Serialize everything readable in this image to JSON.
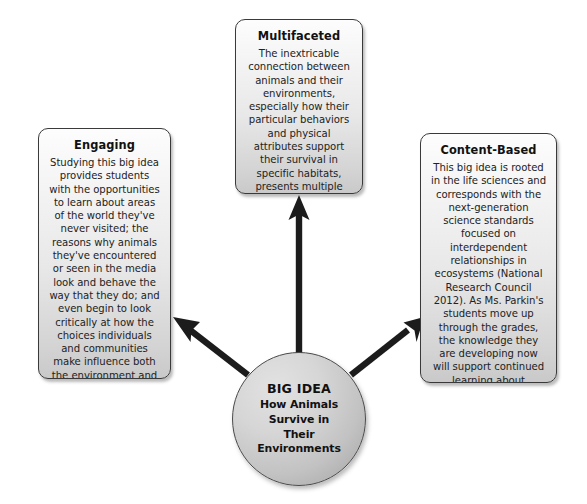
{
  "diagram": {
    "center": {
      "label": "BIG IDEA",
      "text": "How Animals Survive in Their Environments",
      "text_lines": [
        "How Animals",
        "Survive in",
        "Their",
        "Environments"
      ]
    },
    "nodes": [
      {
        "id": "multifaceted",
        "title": "Multifaceted",
        "body": "The inextricable connection between animals and their environments, especially how their particular behaviors and physical attributes support their survival in specific habitats, presents multiple avenues for questioning, wondering, and discovery.",
        "position": "top"
      },
      {
        "id": "engaging",
        "title": "Engaging",
        "body": "Studying this big idea provides students with the opportunities to learn about areas of the world they've never visited; the reasons why animals they've encountered or seen in the media look and behave the way that they do; and even begin to look critically at how the choices individuals and communities make influence both the environment and its animal inhabitants.",
        "position": "left"
      },
      {
        "id": "content-based",
        "title": "Content-Based",
        "body": "This big idea is rooted in the life sciences and corresponds with the next-generation science standards focused on interdependent relationships in ecosystems (National Research Council 2012). As Ms. Parkin's students move up through the grades, the knowledge they are developing now will support continued learning about ecosystems, genetic variation, and population shifts.",
        "position": "right"
      }
    ],
    "connectors": [
      {
        "id": "arrow-to-multifaceted",
        "from": "center",
        "to": "multifaceted",
        "direction": "up"
      },
      {
        "id": "arrow-to-engaging",
        "from": "center",
        "to": "engaging",
        "direction": "up-left"
      },
      {
        "id": "arrow-to-content-based",
        "from": "center",
        "to": "content-based",
        "direction": "up-right"
      }
    ],
    "colors": {
      "background": "#ffffff",
      "box_border": "#3a3a3a",
      "box_fill_top": "#fdfdfd",
      "box_fill_bottom": "#c9c9c9",
      "circle_fill": "#c2c2c2",
      "arrow": "#1c1c1c",
      "text": "#1a1a1a"
    }
  }
}
